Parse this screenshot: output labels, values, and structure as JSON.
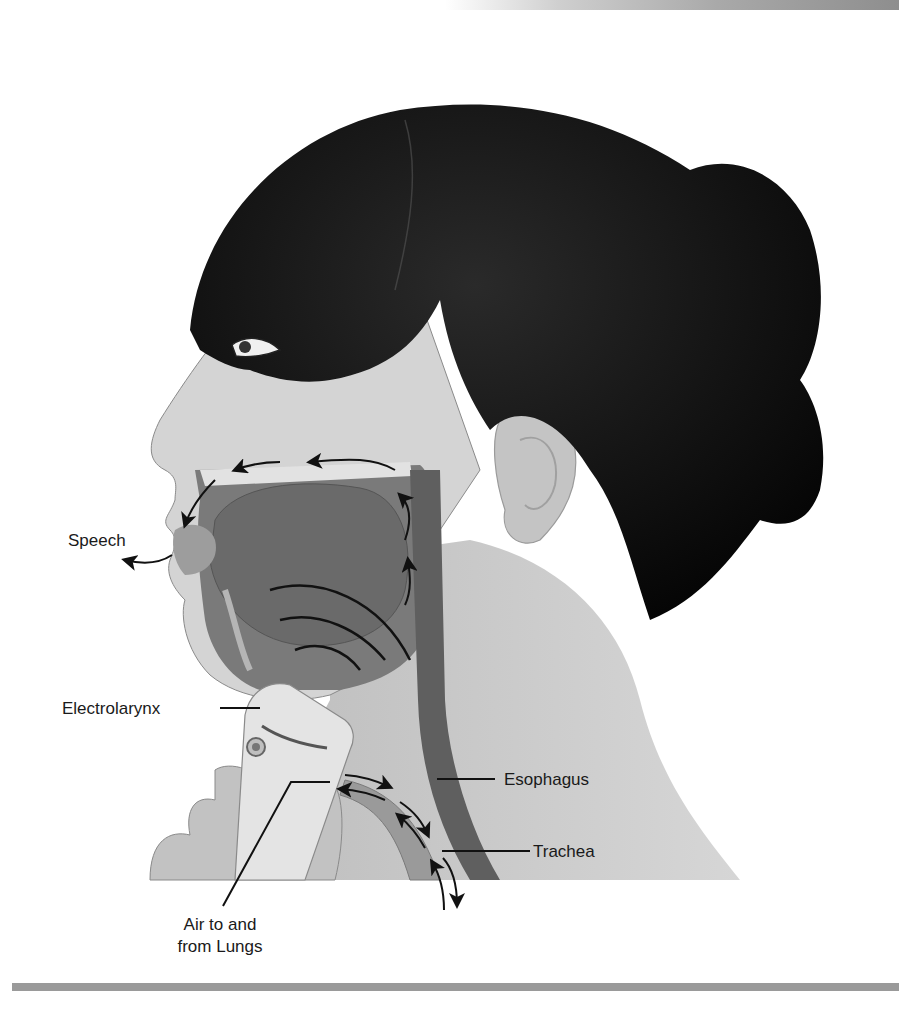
{
  "figure": {
    "labels": {
      "speech": "Speech",
      "electrolarynx": "Electrolarynx",
      "esophagus": "Esophagus",
      "trachea": "Trachea",
      "air_line1": "Air to and",
      "air_line2": "from Lungs"
    },
    "colors": {
      "hair": "#0d0d0d",
      "skin": "#c9c9c9",
      "skin_light": "#dedede",
      "oral_cavity": "#6e6e6e",
      "tongue": "#7d7d7d",
      "airway": "#8a8a8a",
      "esophagus": "#5a5a5a",
      "device": "#e6e6e6",
      "lines": "#111111",
      "bottom_bar": "#9a9a9a"
    }
  }
}
